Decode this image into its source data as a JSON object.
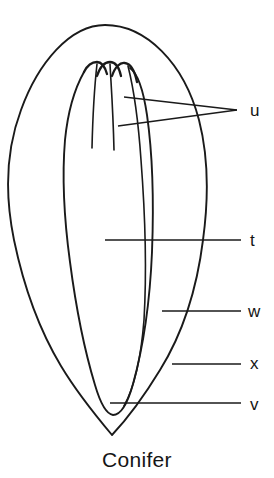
{
  "figure": {
    "caption": "Conifer",
    "background_color": "#ffffff",
    "ink_color": "#1a1a1a"
  },
  "labels": [
    {
      "id": "u",
      "text": "u",
      "x": 250,
      "y": 102,
      "leader_count": 2
    },
    {
      "id": "t",
      "text": "t",
      "x": 250,
      "y": 232,
      "leader_count": 1
    },
    {
      "id": "w",
      "text": "w",
      "x": 248,
      "y": 303,
      "leader_count": 1
    },
    {
      "id": "x",
      "text": "x",
      "x": 250,
      "y": 355,
      "leader_count": 1
    },
    {
      "id": "v",
      "text": "v",
      "x": 250,
      "y": 396,
      "leader_count": 1
    }
  ],
  "leaders": [
    {
      "for": "u",
      "x1": 124,
      "y1": 97,
      "x2": 237,
      "y2": 110
    },
    {
      "for": "u",
      "x1": 118,
      "y1": 126,
      "x2": 237,
      "y2": 110
    },
    {
      "for": "t",
      "x1": 105,
      "y1": 240,
      "x2": 241,
      "y2": 240
    },
    {
      "for": "w",
      "x1": 162,
      "y1": 311,
      "x2": 241,
      "y2": 311
    },
    {
      "for": "x",
      "x1": 172,
      "y1": 364,
      "x2": 241,
      "y2": 364
    },
    {
      "for": "v",
      "x1": 110,
      "y1": 403,
      "x2": 241,
      "y2": 403
    }
  ]
}
